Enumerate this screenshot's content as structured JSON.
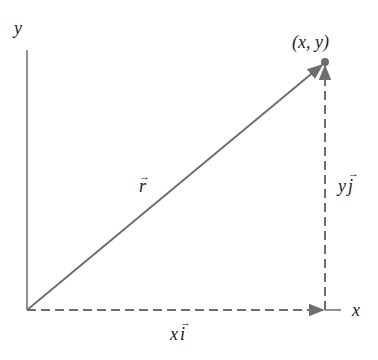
{
  "diagram": {
    "type": "position-vector-decomposition",
    "colors": {
      "vector": "#6e6e6e",
      "axis": "#555555",
      "text": "#222222"
    },
    "axes": {
      "x_label": "x",
      "y_label": "y"
    },
    "point_label": "(x, y)",
    "vector_label": "r",
    "x_component_label": "x",
    "x_component_unit": "i",
    "y_component_label": "y",
    "y_component_unit": "j",
    "arrow_glyph": "→"
  }
}
